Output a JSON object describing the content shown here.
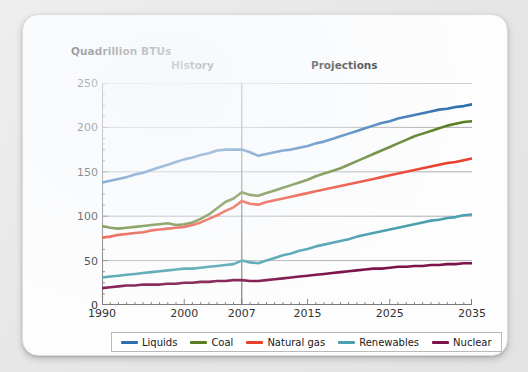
{
  "card": {
    "background_color": "#fdfdfd",
    "page_background_color": "#e9e9e9"
  },
  "chart_data": {
    "type": "line",
    "title": "",
    "ylabel": "Quadrillion BTUs",
    "xlabel": "",
    "ylim": [
      0,
      250
    ],
    "yticks": [
      0,
      50,
      100,
      150,
      200,
      250
    ],
    "xlim": [
      1990,
      2035
    ],
    "xticks": [
      1990,
      2000,
      2007,
      2015,
      2025,
      2035
    ],
    "xtick_labels": [
      "1990",
      "2000",
      "2007",
      "2015",
      "2025",
      "2035"
    ],
    "grid": "horizontal",
    "legend_position": "bottom",
    "annotations": [
      {
        "text": "History",
        "x": 1998
      },
      {
        "text": "Projections",
        "x": 2020
      }
    ],
    "divider_year": 2007,
    "x": [
      1990,
      1991,
      1992,
      1993,
      1994,
      1995,
      1996,
      1997,
      1998,
      1999,
      2000,
      2001,
      2002,
      2003,
      2004,
      2005,
      2006,
      2007,
      2008,
      2009,
      2010,
      2011,
      2012,
      2013,
      2014,
      2015,
      2016,
      2017,
      2018,
      2019,
      2020,
      2021,
      2022,
      2023,
      2024,
      2025,
      2026,
      2027,
      2028,
      2029,
      2030,
      2031,
      2032,
      2033,
      2034,
      2035
    ],
    "series": [
      {
        "name": "Liquids",
        "color": "#2e6fb0",
        "values": [
          138,
          140,
          142,
          144,
          147,
          149,
          152,
          155,
          158,
          161,
          164,
          166,
          169,
          171,
          174,
          175,
          175,
          175,
          172,
          168,
          170,
          172,
          174,
          175,
          177,
          179,
          182,
          184,
          187,
          190,
          193,
          196,
          199,
          202,
          205,
          207,
          210,
          212,
          214,
          216,
          218,
          220,
          221,
          223,
          224,
          226
        ]
      },
      {
        "name": "Coal",
        "color": "#5b7d24",
        "values": [
          89,
          87,
          86,
          87,
          88,
          89,
          90,
          91,
          92,
          90,
          91,
          93,
          97,
          102,
          109,
          116,
          120,
          127,
          124,
          123,
          126,
          129,
          132,
          135,
          138,
          141,
          145,
          148,
          151,
          154,
          158,
          162,
          166,
          170,
          174,
          178,
          182,
          186,
          190,
          193,
          196,
          199,
          202,
          204,
          206,
          207
        ]
      },
      {
        "name": "Natural gas",
        "color": "#e8402a",
        "values": [
          76,
          77,
          79,
          80,
          81,
          82,
          84,
          85,
          86,
          87,
          88,
          90,
          93,
          97,
          101,
          106,
          110,
          117,
          114,
          113,
          116,
          118,
          120,
          122,
          124,
          126,
          128,
          130,
          132,
          134,
          136,
          138,
          140,
          142,
          144,
          146,
          148,
          150,
          152,
          154,
          156,
          158,
          160,
          161,
          163,
          165
        ]
      },
      {
        "name": "Renewables",
        "color": "#4ba0b0",
        "values": [
          31,
          32,
          33,
          34,
          35,
          36,
          37,
          38,
          39,
          40,
          41,
          41,
          42,
          43,
          44,
          45,
          46,
          50,
          48,
          47,
          50,
          53,
          56,
          58,
          61,
          63,
          66,
          68,
          70,
          72,
          74,
          77,
          79,
          81,
          83,
          85,
          87,
          89,
          91,
          93,
          95,
          96,
          98,
          99,
          101,
          102
        ]
      },
      {
        "name": "Nuclear",
        "color": "#7c1349",
        "values": [
          19,
          20,
          21,
          22,
          22,
          23,
          23,
          23,
          24,
          24,
          25,
          25,
          26,
          26,
          27,
          27,
          28,
          28,
          27,
          27,
          28,
          29,
          30,
          31,
          32,
          33,
          34,
          35,
          36,
          37,
          38,
          39,
          40,
          41,
          41,
          42,
          43,
          43,
          44,
          44,
          45,
          45,
          46,
          46,
          47,
          47
        ]
      }
    ]
  },
  "legend": {
    "items": [
      {
        "label": "Liquids",
        "color": "#2e6fb0"
      },
      {
        "label": "Coal",
        "color": "#5b7d24"
      },
      {
        "label": "Natural gas",
        "color": "#e8402a"
      },
      {
        "label": "Renewables",
        "color": "#4ba0b0"
      },
      {
        "label": "Nuclear",
        "color": "#7c1349"
      }
    ]
  }
}
